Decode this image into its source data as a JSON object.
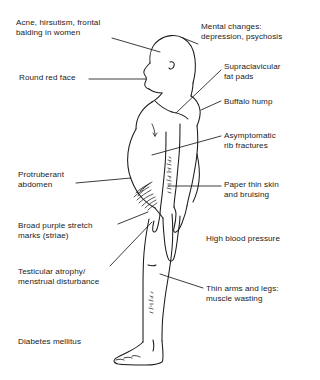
{
  "diagram": {
    "figure_name": "side-profile-patient-body-outline",
    "line_color": "#1a1a1a",
    "background_color": "#ffffff"
  },
  "labels": [
    {
      "id": "acne-hirsutism",
      "text": "Acne, hirsutism, frontal\nbalding in women",
      "side": "left",
      "x": 16,
      "y": 18,
      "has_leader": true
    },
    {
      "id": "mental-changes",
      "text": "Mental changes:\ndepression, psychosis",
      "side": "right",
      "x": 201,
      "y": 22,
      "has_leader": true
    },
    {
      "id": "round-red-face",
      "text": "Round red face",
      "side": "left",
      "x": 19,
      "y": 73,
      "has_leader": true
    },
    {
      "id": "supraclavicular-fat-pads",
      "text": "Supraclavicular\nfat pads",
      "side": "right",
      "x": 224,
      "y": 62,
      "has_leader": true
    },
    {
      "id": "buffalo-hump",
      "text": "Buffalo hump",
      "side": "right",
      "x": 224,
      "y": 97,
      "has_leader": true
    },
    {
      "id": "asymptomatic-rib-fractures",
      "text": "Asymptomatic\nrib fractures",
      "side": "right",
      "x": 224,
      "y": 131,
      "has_leader": true
    },
    {
      "id": "protruberant-abdomen",
      "text": "Protruberant\nabdomen",
      "side": "left",
      "x": 18,
      "y": 170,
      "has_leader": true
    },
    {
      "id": "paper-thin-skin",
      "text": "Paper thin skin\nand bruising",
      "side": "right",
      "x": 224,
      "y": 180,
      "has_leader": true
    },
    {
      "id": "broad-purple-stretch-marks",
      "text": "Broad purple stretch\nmarks (striae)",
      "side": "left",
      "x": 18,
      "y": 221,
      "has_leader": true
    },
    {
      "id": "high-blood-pressure",
      "text": "High blood pressure",
      "side": "right",
      "x": 206,
      "y": 234,
      "has_leader": false
    },
    {
      "id": "testicular-atrophy",
      "text": "Testicular atrophy/\nmenstrual disturbance",
      "side": "left",
      "x": 18,
      "y": 267,
      "has_leader": true
    },
    {
      "id": "thin-arms-and-legs",
      "text": "Thin arms and legs:\nmuscle wasting",
      "side": "right",
      "x": 206,
      "y": 284,
      "has_leader": true
    },
    {
      "id": "diabetes-mellitus",
      "text": "Diabetes mellitus",
      "side": "left",
      "x": 18,
      "y": 337,
      "has_leader": false
    }
  ]
}
